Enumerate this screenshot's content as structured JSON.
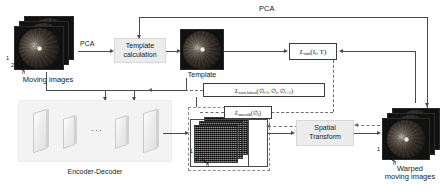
{
  "figure": {
    "type": "flow-diagram"
  },
  "labels": {
    "pca_top": "PCA",
    "pca_left": "PCA",
    "moving_images": "Moving images",
    "template": "Template",
    "encoder_decoder": "Encoder-Decoder",
    "warped_moving_images": "Warped\nmoving images",
    "warped_line1": "Warped",
    "warped_line2": "moving images"
  },
  "boxes": {
    "template_calculation": {
      "line1": "Template",
      "line2": "calculation"
    },
    "spatial_transform": {
      "line1": "Spatial",
      "line2": "Transform"
    }
  },
  "losses": {
    "similarity": {
      "symbol": "L",
      "subscript": "sim",
      "args": "(I",
      "arg_sub": "i",
      "args_tail": ", T)",
      "full": "L_sim(I_i, T)"
    },
    "correlation": {
      "symbol": "L",
      "subscript": "correlation",
      "arg_open": "(∅",
      "arg1_sub": "i-1",
      "arg_sep1": ", ∅",
      "arg2_sub": "i",
      "arg_sep2": ", ∅",
      "arg3_sub": "i+1",
      "arg_close": ")",
      "full": "L_correlation(∅_{i-1}, ∅_i, ∅_{i+1})"
    },
    "smooth": {
      "symbol": "L",
      "subscript": "smooth",
      "arg_open": "(∅",
      "arg1_sub": "i",
      "arg_close": ")",
      "full": "L_smooth(∅_i)"
    }
  },
  "stack_indices": {
    "first": "1",
    "second": "2",
    "last": "n"
  },
  "colors": {
    "process_box_fill": "#ececec",
    "process_box_border": "#d8d8d8",
    "loss_box_border": "#3b3b3b",
    "connector": "#4a4a4a",
    "dashed_connector": "#6e6e6e",
    "encoder_panel_fill": "#f3f3f3",
    "image_dark": "#111111",
    "text": "#1a1a1a"
  },
  "ed_dots": "···"
}
